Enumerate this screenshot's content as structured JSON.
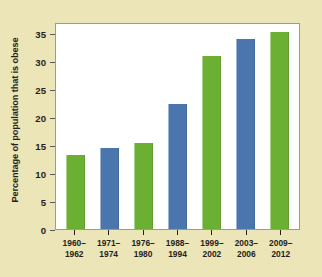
{
  "figure": {
    "background_color": "#ece5b8",
    "plot_background_color": "#ffffff",
    "plot_border_color": "#9c9a94"
  },
  "axes": {
    "y_title": "Percentage of population that is obese",
    "y_ticks": [
      "0",
      "5",
      "10",
      "15",
      "20",
      "25",
      "30",
      "35"
    ]
  },
  "chart_data": {
    "type": "bar",
    "title": "",
    "xlabel": "",
    "ylabel": "Percentage of population that is obese",
    "ylim": [
      0,
      37
    ],
    "grid": false,
    "legend": "none",
    "categories": [
      "1960–1962",
      "1971–1974",
      "1976–1980",
      "1988–1994",
      "1999–2002",
      "2003–2006",
      "2009–2012"
    ],
    "category_lines": [
      [
        "1960–",
        "1962"
      ],
      [
        "1971–",
        "1974"
      ],
      [
        "1976–",
        "1980"
      ],
      [
        "1988–",
        "1994"
      ],
      [
        "1999–",
        "2002"
      ],
      [
        "2003–",
        "2006"
      ],
      [
        "2009–",
        "2012"
      ]
    ],
    "values": [
      13.2,
      14.5,
      15.3,
      22.4,
      30.9,
      33.9,
      35.3
    ],
    "bar_colors": [
      "#6cb033",
      "#4a76ad",
      "#6cb033",
      "#4a76ad",
      "#6cb033",
      "#4a76ad",
      "#6cb033"
    ],
    "colors": {
      "green": "#6cb033",
      "blue": "#4a76ad"
    },
    "y_tick_values": [
      0,
      5,
      10,
      15,
      20,
      25,
      30,
      35
    ]
  }
}
